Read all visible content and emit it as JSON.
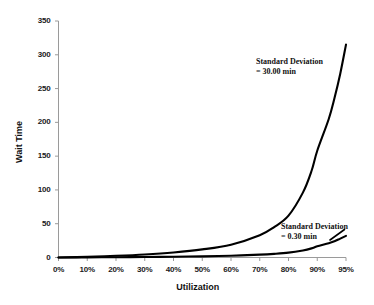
{
  "chart_data": {
    "type": "line",
    "title": "",
    "xlabel": "Utilization",
    "ylabel": "Wait Time",
    "x_tick_labels": [
      "0%",
      "10%",
      "20%",
      "30%",
      "40%",
      "50%",
      "60%",
      "70%",
      "80%",
      "90%",
      "95%"
    ],
    "x_tick_values": [
      0,
      10,
      20,
      30,
      40,
      50,
      60,
      70,
      80,
      90,
      95
    ],
    "y_tick_labels": [
      "0",
      "50",
      "100",
      "150",
      "200",
      "250",
      "300",
      "350"
    ],
    "y_tick_values": [
      0,
      50,
      100,
      150,
      200,
      250,
      300,
      350
    ],
    "ylim": [
      0,
      350
    ],
    "grid": false,
    "legend_position": "inline-annotations",
    "line_color": "#000000",
    "background_color": "#ffffff",
    "series": [
      {
        "name": "Standard Deviation = 30.00 min",
        "annotation_line1": "Standard Deviation",
        "annotation_line2": "= 30.00 min",
        "x": [
          0,
          10,
          20,
          30,
          40,
          50,
          60,
          70,
          75,
          80,
          85,
          88,
          90,
          92,
          93,
          94,
          95
        ],
        "values": [
          0,
          1,
          2.5,
          4.5,
          7.5,
          12,
          19,
          33,
          45,
          62,
          96,
          128,
          158,
          205,
          236,
          272,
          315
        ]
      },
      {
        "name": "Standard Deviation = 0.30 min",
        "annotation_line1": "Standard Deviation",
        "annotation_line2": "= 0.30 min",
        "x": [
          0,
          10,
          20,
          30,
          40,
          50,
          60,
          70,
          75,
          80,
          85,
          88,
          90,
          92,
          93,
          94,
          95
        ],
        "values": [
          0,
          0.2,
          0.4,
          0.7,
          1.1,
          1.7,
          2.6,
          4.2,
          5.4,
          7.2,
          10.5,
          13.5,
          16.5,
          21,
          24,
          28,
          32
        ]
      }
    ]
  },
  "annotations": {
    "upper": {
      "line1": "Standard Deviation",
      "line2": "= 30.00 min"
    },
    "lower": {
      "line1": "Standard Deviation",
      "line2": "= 0.30 min"
    }
  },
  "axes": {
    "x_title": "Utilization",
    "y_title": "Wait Time"
  }
}
